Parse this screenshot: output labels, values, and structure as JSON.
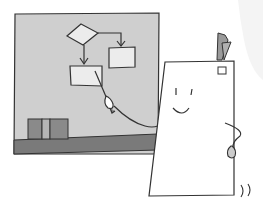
{
  "illustration": {
    "subject": "paper character presenting a flowchart on a board",
    "colors": {
      "background": "#ffffff",
      "board": "#cfcfcf",
      "board_ledge": "#7a7a7a",
      "books": "#8a8a8a",
      "book_gap": "#b5b5b5",
      "flowchart_shape_fill": "#ececec",
      "paper": "#ffffff",
      "clip": "#9a9a9a",
      "line": "#333333",
      "faint_corner": "#f4f4f4"
    },
    "flowchart": {
      "shapes": [
        "decision-diamond",
        "process-box-left",
        "process-box-right"
      ],
      "arrows": 2
    },
    "character": {
      "face": "smile",
      "holding": "pointer",
      "motion_marks": "))"
    }
  }
}
